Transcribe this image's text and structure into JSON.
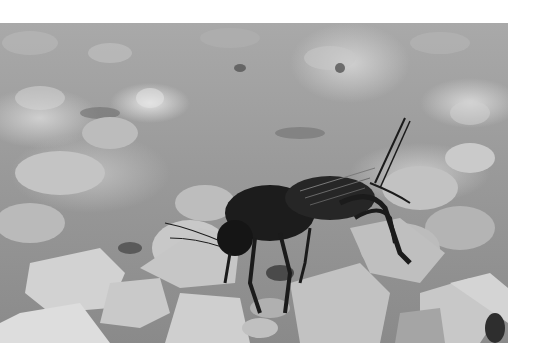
{
  "image": {
    "subject": "cricket on gravel",
    "style": "grayscale photograph",
    "alt": "Black cricket standing on light gray gravel stones"
  }
}
